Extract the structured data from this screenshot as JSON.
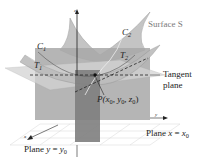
{
  "diagram": {
    "type": "3d-surface-tangent-plane",
    "labels": {
      "surface": "Surface S",
      "curve_1": "C",
      "curve_1_sub": "1",
      "curve_2": "C",
      "curve_2_sub": "2",
      "tangent_1": "T",
      "tangent_1_sub": "1",
      "tangent_2": "T",
      "tangent_2_sub": "2",
      "tangent_plane_line1": "Tangent",
      "tangent_plane_line2": "plane",
      "point_prefix": "P(",
      "point_x": "x",
      "point_y": "y",
      "point_z": "z",
      "point_sub": "0",
      "point_sep": ", ",
      "point_suffix": ")",
      "plane_x_prefix": "Plane ",
      "plane_x_var": "x",
      "plane_x_eq": " = ",
      "plane_x_val": "x",
      "plane_x_sub": "0",
      "plane_y_prefix": "Plane ",
      "plane_y_var": "y",
      "plane_y_eq": " = ",
      "plane_y_val": "y",
      "plane_y_sub": "0",
      "axis_x": "x",
      "axis_y": "y",
      "axis_z": "z"
    },
    "colors": {
      "surface": "#bdbdbd",
      "surface_dark": "#8c8c8c",
      "plane_x": "#9e9e9e",
      "plane_y": "#7d7d7d",
      "tangent_plane": "#cfcfcf",
      "lines": "#222222",
      "grid": "#d0d0d0"
    }
  }
}
